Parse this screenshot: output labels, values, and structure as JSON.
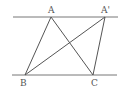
{
  "diagram": {
    "title": "",
    "type": "geometry",
    "colors": {
      "stroke": "#555555",
      "label": "#555555",
      "background": "#ffffff"
    },
    "parallel_lines": [
      {
        "name": "top-line",
        "x1": 13,
        "y1": 17,
        "x2": 118,
        "y2": 17
      },
      {
        "name": "bottom-line",
        "x1": 12,
        "y1": 75,
        "x2": 117,
        "y2": 75
      }
    ],
    "points": {
      "A": {
        "label": "A",
        "x": 51,
        "y": 17,
        "label_x": 48,
        "label_y": 13
      },
      "A2": {
        "label": "A'",
        "x": 105,
        "y": 17,
        "label_x": 101,
        "label_y": 13
      },
      "B": {
        "label": "B",
        "x": 25,
        "y": 75,
        "label_x": 20,
        "label_y": 86
      },
      "C": {
        "label": "C",
        "x": 93,
        "y": 75,
        "label_x": 91,
        "label_y": 86
      }
    },
    "segments": [
      {
        "from": "A",
        "to": "B"
      },
      {
        "from": "A",
        "to": "C"
      },
      {
        "from": "A2",
        "to": "B"
      },
      {
        "from": "A2",
        "to": "C"
      }
    ]
  }
}
